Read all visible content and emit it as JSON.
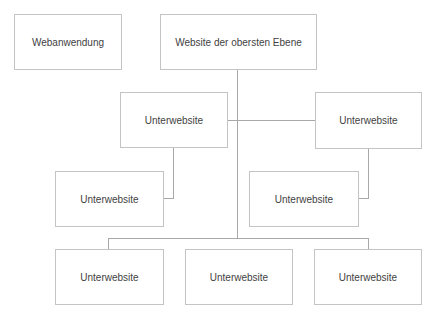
{
  "diagram": {
    "colors": {
      "text": "#3f3f3f",
      "border": "#c4c4c4",
      "connector": "#a8a8a8",
      "background": "#ffffff"
    },
    "nodes": {
      "web_app": "Webanwendung",
      "top_level": "Website der obersten Ebene",
      "sub_mid_left": "Unterwebsite",
      "sub_mid_right": "Unterwebsite",
      "sub_lower_left": "Unterwebsite",
      "sub_lower_right": "Unterwebsite",
      "sub_bottom_1": "Unterwebsite",
      "sub_bottom_2": "Unterwebsite",
      "sub_bottom_3": "Unterwebsite"
    }
  }
}
